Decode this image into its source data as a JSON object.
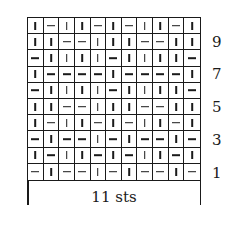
{
  "chart_data": {
    "type": "table",
    "title": "",
    "legend": {
      "|": "knit",
      "-": "purl"
    },
    "columns": 11,
    "rows": 10,
    "grid": [
      [
        "|",
        "-",
        "|",
        "|",
        "-",
        "|",
        "-",
        "|",
        "|",
        "-",
        "|"
      ],
      [
        "|",
        "|",
        "-",
        "-",
        "|",
        "|",
        "|",
        "-",
        "-",
        "|",
        "|"
      ],
      [
        "-",
        "|",
        "|",
        "|",
        "|",
        "-",
        "|",
        "|",
        "|",
        "|",
        "-"
      ],
      [
        "|",
        "-",
        "-",
        "-",
        "-",
        "|",
        "-",
        "-",
        "-",
        "-",
        "|"
      ],
      [
        "-",
        "|",
        "|",
        "|",
        "|",
        "-",
        "|",
        "|",
        "|",
        "|",
        "-"
      ],
      [
        "|",
        "|",
        "-",
        "-",
        "|",
        "|",
        "|",
        "-",
        "-",
        "|",
        "|"
      ],
      [
        "|",
        "-",
        "|",
        "|",
        "-",
        "|",
        "-",
        "|",
        "|",
        "-",
        "|"
      ],
      [
        "-",
        "|",
        "-",
        "-",
        "|",
        "-",
        "|",
        "-",
        "-",
        "|",
        "-"
      ],
      [
        "|",
        "-",
        "|",
        "|",
        "-",
        "|",
        "-",
        "|",
        "|",
        "-",
        "|"
      ],
      [
        "-",
        "|",
        "-",
        "-",
        "|",
        "-",
        "|",
        "-",
        "-",
        "|",
        "-"
      ]
    ],
    "row_labels": [
      "9",
      "7",
      "5",
      "3",
      "1"
    ],
    "xlabel": "11 sts"
  },
  "row_numbers": [
    {
      "label": "9",
      "row_index": 1
    },
    {
      "label": "7",
      "row_index": 3
    },
    {
      "label": "5",
      "row_index": 5
    },
    {
      "label": "3",
      "row_index": 7
    },
    {
      "label": "1",
      "row_index": 9
    }
  ],
  "repeat_label": "11 sts"
}
